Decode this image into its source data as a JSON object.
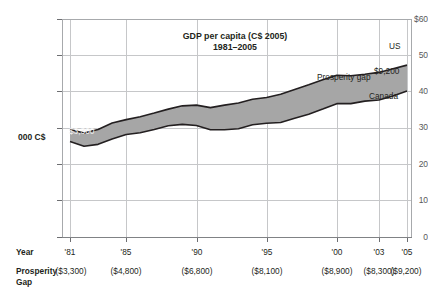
{
  "chart_data": {
    "type": "area",
    "title": "GDP per capita (C$ 2005)",
    "subtitle": "1981–2005",
    "ylabel": "000 C$",
    "xlabel": "Year",
    "ylim": [
      0,
      60
    ],
    "grid": true,
    "y_ticks": [
      "$60",
      "50",
      "40",
      "30",
      "20",
      "10",
      "0"
    ],
    "y_tick_values": [
      60,
      50,
      40,
      30,
      20,
      10,
      0
    ],
    "x_ticks": [
      "'81",
      "'85",
      "'90",
      "'95",
      "'00",
      "'03",
      "'05"
    ],
    "x_tick_years": [
      1981,
      1985,
      1990,
      1995,
      2000,
      2003,
      2005
    ],
    "legend_position": "inline-annotations",
    "annotations": [
      {
        "text": "US",
        "series": "US",
        "at_year": 2005
      },
      {
        "text": "Canada",
        "series": "Canada",
        "at_year": 2005
      },
      {
        "text": "Prosperity gap",
        "series": "gap"
      },
      {
        "text": "$9,200",
        "series": "gap",
        "at_year": 2005
      },
      {
        "text": "$3,300",
        "series": "gap",
        "at_year": 1981
      }
    ],
    "x": [
      1981,
      1982,
      1983,
      1984,
      1985,
      1986,
      1987,
      1988,
      1989,
      1990,
      1991,
      1992,
      1993,
      1994,
      1995,
      1996,
      1997,
      1998,
      1999,
      2000,
      2001,
      2002,
      2003,
      2004,
      2005
    ],
    "series": [
      {
        "name": "US",
        "values": [
          29.6,
          28.6,
          29.6,
          31.4,
          32.3,
          33.1,
          34.1,
          35.2,
          36.1,
          36.3,
          35.6,
          36.3,
          36.9,
          37.9,
          38.4,
          39.3,
          40.6,
          41.9,
          43.3,
          44.5,
          44.4,
          44.8,
          45.3,
          46.3,
          47.3
        ]
      },
      {
        "name": "Canada",
        "values": [
          26.3,
          25.0,
          25.5,
          27.0,
          28.2,
          28.7,
          29.6,
          30.6,
          31.0,
          30.7,
          29.5,
          29.5,
          29.8,
          30.9,
          31.3,
          31.5,
          32.7,
          33.8,
          35.2,
          36.7,
          36.7,
          37.4,
          37.7,
          38.8,
          40.2
        ]
      }
    ],
    "prosperity_gap": {
      "row_label": "Prosperity\nGap",
      "at_years": [
        1981,
        1985,
        1990,
        1995,
        2000,
        2003,
        2005
      ],
      "labels": [
        "($3,300)",
        "($4,800)",
        "($6,800)",
        "($8,100)",
        "($8,900)",
        "($8,300)",
        "($9,200)"
      ],
      "values": [
        -3300,
        -4800,
        -6800,
        -8100,
        -8900,
        -8300,
        -9200
      ]
    },
    "colors": {
      "band_fill": "#a6a6a6",
      "line": "#231f20",
      "grid": "#c6c7c9",
      "frame": "#a7a9ac",
      "text": "#231f20",
      "axis_label": "#58595b"
    }
  }
}
